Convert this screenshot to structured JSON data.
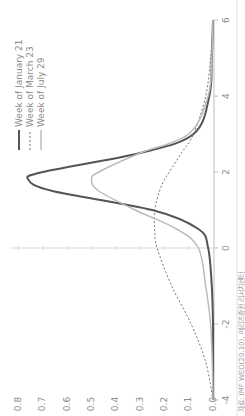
{
  "chart_data": {
    "type": "line",
    "title": "",
    "xlabel": "",
    "ylabel": "",
    "orientation": "rotated-90-ccw",
    "xlim": [
      -4,
      6
    ],
    "ylim": [
      0.0,
      0.8
    ],
    "x_ticks": [
      "-4",
      "-2",
      "0",
      "2",
      "4",
      "6"
    ],
    "y_ticks": [
      "0.0",
      "0.1",
      "0.2",
      "0.3",
      "0.4",
      "0.5",
      "0.6",
      "0.7",
      "0.8"
    ],
    "grid": false,
    "legend_position": "top-left (rotated)",
    "x": [
      -4,
      -3,
      -2,
      -1,
      0,
      0.5,
      1,
      1.5,
      1.8,
      2,
      2.5,
      3,
      4,
      5,
      6
    ],
    "series": [
      {
        "name": "Week of January 21",
        "style": "solid-dark",
        "values": [
          0.0,
          0.0,
          0.0,
          0.005,
          0.02,
          0.06,
          0.25,
          0.66,
          0.76,
          0.7,
          0.3,
          0.08,
          0.015,
          0.005,
          0.0
        ]
      },
      {
        "name": "Week of March 23",
        "style": "dashed",
        "values": [
          0.0,
          0.03,
          0.09,
          0.17,
          0.23,
          0.24,
          0.24,
          0.22,
          0.2,
          0.18,
          0.13,
          0.08,
          0.03,
          0.01,
          0.0
        ]
      },
      {
        "name": "Week of July 29",
        "style": "solid-light",
        "values": [
          0.0,
          0.003,
          0.01,
          0.03,
          0.06,
          0.15,
          0.32,
          0.47,
          0.5,
          0.47,
          0.3,
          0.1,
          0.02,
          0.005,
          0.0
        ]
      }
    ]
  },
  "legend": {
    "items": [
      "Week of January 21",
      "Week of March 23",
      "Week of July 29"
    ]
  },
  "axis": {
    "x_ticks": [
      "-4",
      "-2",
      "0",
      "2",
      "4",
      "6"
    ],
    "y_ticks": [
      "0.0",
      "0.1",
      "0.2",
      "0.3",
      "0.4",
      "0.5",
      "0.6",
      "0.7",
      "0.8"
    ]
  },
  "source": "자료: IMF WEO(20.10), 메리츠증권 리서치센터",
  "colors": {
    "jan": "#555555",
    "mar": "#777777",
    "jul": "#bbbbbb",
    "axis": "#bdbdbd",
    "text": "#8a8a8a"
  }
}
